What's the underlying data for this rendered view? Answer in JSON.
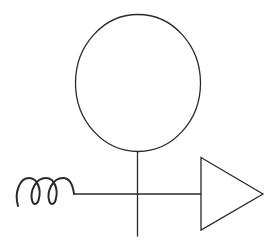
{
  "diagram": {
    "type": "schematic-symbol",
    "colors": {
      "background": "#ffffff",
      "stroke": "#2a2a2a"
    },
    "elements": [
      {
        "name": "circle",
        "shape": "ellipse",
        "cx": 138,
        "cy": 83,
        "rx": 62.5,
        "ry": 68.5
      },
      {
        "name": "vertical-stem",
        "shape": "line",
        "x1": 137.5,
        "y1": 151.5,
        "x2": 137.5,
        "y2": 236
      },
      {
        "name": "horizontal-line",
        "shape": "line",
        "x1": 74,
        "y1": 194,
        "x2": 201,
        "y2": 194
      },
      {
        "name": "coil",
        "shape": "spring",
        "loops": 3,
        "x_start": 18,
        "x_end": 74,
        "y_top": 178,
        "y_bottom": 206
      },
      {
        "name": "triangle-arrow",
        "shape": "triangle",
        "points": [
          [
            201,
            157.5
          ],
          [
            263,
            194
          ],
          [
            201,
            230
          ]
        ]
      }
    ]
  }
}
